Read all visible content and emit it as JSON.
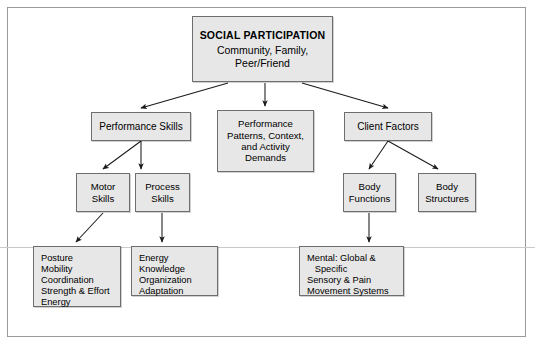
{
  "diagram": {
    "nodes": {
      "social_participation": {
        "heading": "SOCIAL PARTICIPATION",
        "line1": "Community, Family,",
        "line2": "Peer/Friend"
      },
      "performance_skills": {
        "label": "Performance Skills"
      },
      "performance_patterns": {
        "line1": "Performance",
        "line2": "Patterns, Context,",
        "line3": "and Activity",
        "line4": "Demands"
      },
      "client_factors": {
        "label": "Client Factors"
      },
      "motor_skills": {
        "line1": "Motor",
        "line2": "Skills"
      },
      "process_skills": {
        "line1": "Process",
        "line2": "Skills"
      },
      "body_functions": {
        "line1": "Body",
        "line2": "Functions"
      },
      "body_structures": {
        "line1": "Body",
        "line2": "Structures"
      },
      "motor_skills_detail": {
        "items": [
          "Posture",
          "Mobility",
          "Coordination",
          "Strength & Effort",
          "Energy"
        ]
      },
      "process_skills_detail": {
        "items": [
          "Energy",
          "Knowledge",
          "Organization",
          "Adaptation"
        ]
      },
      "body_functions_detail": {
        "items": [
          "Mental: Global &",
          "   Specific",
          "Sensory & Pain",
          "Movement Systems"
        ]
      }
    },
    "style": {
      "box_fill": "#e7e7e7",
      "box_border": "#6e6e6e",
      "frame_border": "#9a9a9a",
      "connector": "#1a1a1a",
      "page_background": "#ffffff"
    }
  }
}
